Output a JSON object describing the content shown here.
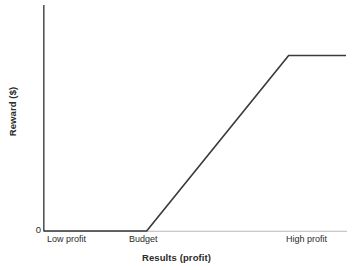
{
  "chart_data": {
    "type": "line",
    "title": "",
    "xlabel": "Results (profit)",
    "ylabel": "Reward ($)",
    "grid": false,
    "legend": "none",
    "x_tick_labels": [
      "Low profit",
      "Budget",
      "High profit"
    ],
    "y_tick_labels": [
      "0"
    ],
    "xlim": [
      0,
      1
    ],
    "ylim": [
      0,
      1
    ],
    "annotations": [],
    "series": [
      {
        "name": "Reward payout curve",
        "description": "Flat at zero below budget, rises linearly from budget, then caps at a maximum near high profit",
        "points": [
          {
            "x": 0.0,
            "y": 0.0,
            "x_label": "Low profit",
            "y_label": "0"
          },
          {
            "x": 0.34,
            "y": 0.0,
            "x_label": "Budget",
            "y_label": "0"
          },
          {
            "x": 0.81,
            "y": 1.0,
            "x_label": "High profit",
            "y_label": "Maximum reward"
          },
          {
            "x": 1.0,
            "y": 1.0,
            "x_label": "",
            "y_label": "Maximum reward"
          }
        ]
      }
    ],
    "colors": {
      "line": "#3a3a3a",
      "axis": "#555555",
      "baseline_extension": "#b8b8b8",
      "text": "#2b2b2b",
      "background": "#ffffff"
    }
  },
  "axes": {
    "y_title": "Reward ($)",
    "x_title": "Results (profit)",
    "y_zero_label": "0",
    "x_ticks": {
      "low": "Low profit",
      "budget": "Budget",
      "high": "High profit"
    }
  }
}
